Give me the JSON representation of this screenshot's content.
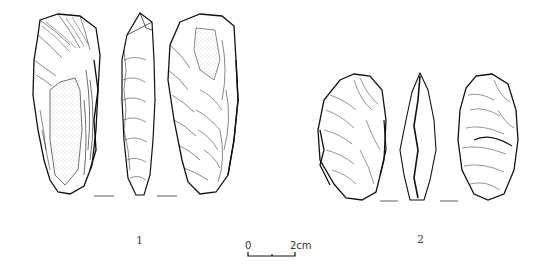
{
  "figure": {
    "artifacts": [
      {
        "id": "1",
        "label": "1",
        "views": [
          "dorsal-face",
          "lateral-profile",
          "ventral-face"
        ],
        "description": "elongated flaked stone tool with cortex (stippled) on dorsal face"
      },
      {
        "id": "2",
        "label": "2",
        "views": [
          "dorsal-face",
          "lateral-profile",
          "ventral-face"
        ],
        "description": "oval bifacially flaked stone tool"
      }
    ],
    "scale_bar": {
      "start_label": "0",
      "end_label": "2cm"
    },
    "colors": {
      "ink": "#111111",
      "background": "#ffffff"
    }
  }
}
